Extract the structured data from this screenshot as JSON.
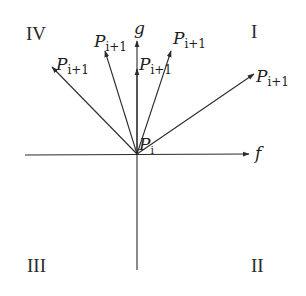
{
  "diagram": {
    "axes": {
      "horizontal_label": "f",
      "vertical_label": "g",
      "origin_label": "P",
      "origin_subscript": "i"
    },
    "quadrants": {
      "I": "I",
      "II": "II",
      "III": "III",
      "IV": "IV"
    },
    "vectors": [
      {
        "label": "P",
        "subscript": "i+1",
        "direction": "upper-left-shallow"
      },
      {
        "label": "P",
        "subscript": "i+1",
        "direction": "upper-left-steep"
      },
      {
        "label": "P",
        "subscript": "i+1",
        "direction": "vertical"
      },
      {
        "label": "P",
        "subscript": "i+1",
        "direction": "upper-right-steep"
      },
      {
        "label": "P",
        "subscript": "i+1",
        "direction": "upper-right-shallow"
      }
    ],
    "stroke_color": "#2b2b2b"
  }
}
